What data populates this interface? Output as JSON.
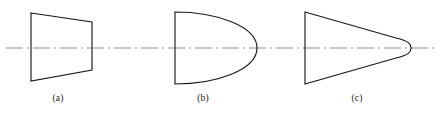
{
  "figure": {
    "width": 443,
    "height": 114,
    "background_color": "#ffffff",
    "centerline": {
      "name": "axis-of-symmetry",
      "y": 48,
      "x_start": 6,
      "x_end": 437,
      "color": "#b3b3b3",
      "style": "dash-dot",
      "dash_pattern": "17 4 2 4"
    },
    "stroke_color": "#1a1a1a",
    "stroke_width": 1.15
  },
  "shapes": [
    {
      "id": "shape-a",
      "label": "(a)",
      "label_x": 58,
      "label_y": 94,
      "type": "trapezoid",
      "description": "Trapezoid with tall vertical left edge and shorter vertical right edge",
      "path": "M 31 13 L 92 22 L 92 70 L 31 81 Z",
      "left_edge_x": 31,
      "right_edge_x": 92,
      "left_top_y": 13,
      "left_bottom_y": 81,
      "right_top_y": 22,
      "right_bottom_y": 70
    },
    {
      "id": "shape-b",
      "label": "(b)",
      "label_x": 203,
      "label_y": 94,
      "type": "d-shape-parabolic",
      "description": "Vertical flat left edge closed by a parabolic curve bulging to the right, tip on the axis",
      "path": "M 175 12 L 175 84 C 216 84 257 70 257 48 C 257 26 216 12 175 12 Z",
      "left_edge_x": 175,
      "left_top_y": 12,
      "left_bottom_y": 84,
      "tip_x": 257,
      "tip_y": 48
    },
    {
      "id": "shape-c",
      "label": "(c)",
      "label_x": 357,
      "label_y": 94,
      "type": "triangle-rounded-nose",
      "description": "Triangle with vertical flat left edge and straight sides converging to a small rounded nose on the axis",
      "path": "M 305 12 L 396 38 C 409 41 411 44 411 48 C 411 52 409 55 396 58 L 305 84 Z",
      "left_edge_x": 305,
      "left_top_y": 12,
      "left_bottom_y": 84,
      "tip_x": 411,
      "tip_y": 48
    }
  ]
}
